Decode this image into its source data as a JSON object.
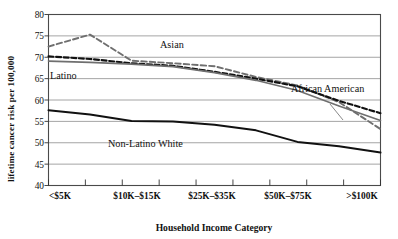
{
  "chart_data": {
    "type": "line",
    "title": "",
    "xlabel": "Household  Income Category",
    "ylabel": "lifetime cancer risk per 100,000",
    "ylim": [
      40,
      80
    ],
    "yticks": [
      40,
      45,
      50,
      55,
      60,
      65,
      70,
      75,
      80
    ],
    "grid": true,
    "legend_position": "inline-annotations",
    "x_tick_count": 10,
    "xtick_labels": [
      "<$5K",
      "$10K–$15K",
      "$25K–$35K",
      "$50K–$75K",
      ">$100K"
    ],
    "categories": [
      "<$5K",
      "$5K–$10K",
      "$10K–$15K",
      "$15K–$25K",
      "$25K–$35K",
      "$35K–$50K",
      "$50K–$75K",
      "$75K–$100K",
      ">$100K"
    ],
    "series": [
      {
        "name": "Asian",
        "style": "dashed",
        "color": "#6f6f6f",
        "values": [
          72.5,
          75.3,
          69.2,
          68.6,
          67.9,
          65.4,
          63.4,
          59.5,
          53.2
        ]
      },
      {
        "name": "African American",
        "style": "dashed",
        "color": "#111111",
        "values": [
          70.2,
          69.6,
          68.6,
          68.0,
          66.6,
          65.0,
          63.2,
          59.8,
          56.9
        ]
      },
      {
        "name": "Latino",
        "style": "solid",
        "color": "#6f6f6f",
        "values": [
          69.1,
          68.8,
          68.4,
          67.8,
          66.4,
          64.6,
          62.2,
          58.6,
          55.2
        ]
      },
      {
        "name": "Non-Latino White",
        "style": "solid",
        "color": "#111111",
        "values": [
          57.6,
          56.6,
          55.1,
          55.0,
          54.2,
          52.9,
          50.2,
          49.2,
          47.7
        ]
      }
    ],
    "annotations": [
      {
        "label": "Asian",
        "x": 160,
        "y": 48
      },
      {
        "label": "Latino",
        "x": 50,
        "y": 79
      },
      {
        "label": "African American",
        "x": 291,
        "y": 92
      },
      {
        "label": "Non-Latino White",
        "x": 108,
        "y": 147
      }
    ]
  },
  "axis": {
    "y_title": "lifetime cancer risk per 100,000",
    "x_title": "Household  Income Category",
    "ytick_0": "40",
    "ytick_1": "45",
    "ytick_2": "50",
    "ytick_3": "55",
    "ytick_4": "60",
    "ytick_5": "65",
    "ytick_6": "70",
    "ytick_7": "75",
    "ytick_8": "80",
    "xtick_0": "<$5K",
    "xtick_1": "$10K–$15K",
    "xtick_2": "$25K–$35K",
    "xtick_3": "$50K–$75K",
    "xtick_4": ">$100K"
  },
  "labels": {
    "asian": "Asian",
    "latino": "Latino",
    "african_american": "African American",
    "non_latino_white": "Non-Latino White"
  },
  "colors": {
    "grey_series": "#6f6f6f",
    "black_series": "#111111",
    "grid": "#8d8d8d",
    "frame": "#4a4a4a",
    "background": "#ffffff"
  }
}
